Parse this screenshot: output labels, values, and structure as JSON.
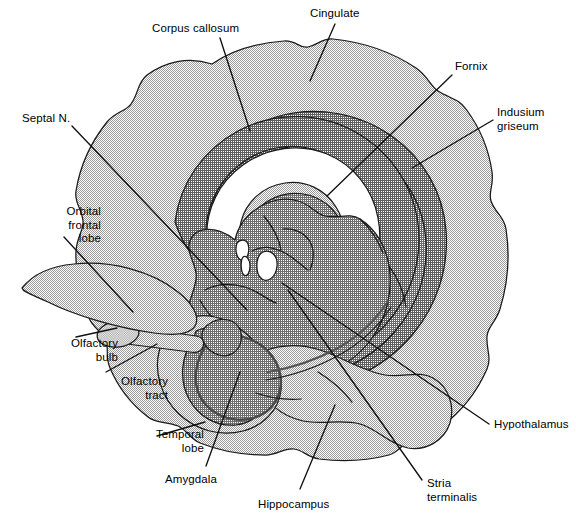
{
  "figure": {
    "type": "anatomical-diagram",
    "background_color": "#ffffff",
    "line_color": "#1a1a1a",
    "palette": {
      "cortex_light": "#c9c9c9",
      "band_medium": "#a8a8a8",
      "band_dark": "#8f8f8f",
      "core_gray": "#9d9d9d",
      "white_space": "#ffffff",
      "outline": "#1a1a1a"
    }
  },
  "labels": [
    {
      "id": "corpus-callosum",
      "text": "Corpus callosum",
      "align": "center",
      "x": 152,
      "y": 22
    },
    {
      "id": "cingulate",
      "text": "Cingulate",
      "align": "center",
      "x": 310,
      "y": 7
    },
    {
      "id": "fornix",
      "text": "Fornix",
      "align": "center",
      "x": 455,
      "y": 60
    },
    {
      "id": "indusium-griseum",
      "text": "Indusium\ngriseum",
      "align": "left",
      "x": 497,
      "y": 106
    },
    {
      "id": "septal-n",
      "text": "Septal N.",
      "align": "left",
      "x": 22,
      "y": 112
    },
    {
      "id": "orbital-frontal-lobe",
      "text": "Orbital\nfrontal\nlobe",
      "align": "right",
      "x": 5,
      "y": 205
    },
    {
      "id": "olfactory-bulb",
      "text": "Olfactory\nbulb",
      "align": "right",
      "x": 22,
      "y": 337
    },
    {
      "id": "olfactory-tract",
      "text": "Olfactory\ntract",
      "align": "right",
      "x": 72,
      "y": 375
    },
    {
      "id": "temporal-lobe",
      "text": "Temporal\nlobe",
      "align": "right",
      "x": 108,
      "y": 428
    },
    {
      "id": "amygdala",
      "text": "Amygdala",
      "align": "center",
      "x": 165,
      "y": 473
    },
    {
      "id": "hippocampus",
      "text": "Hippocampus",
      "align": "center",
      "x": 258,
      "y": 498
    },
    {
      "id": "stria-terminalis",
      "text": "Stria\nterminalis",
      "align": "left",
      "x": 427,
      "y": 477
    },
    {
      "id": "hypothalamus",
      "text": "Hypothalamus",
      "align": "left",
      "x": 494,
      "y": 418
    }
  ],
  "leader_lines": [
    {
      "id": "corpus-callosum",
      "x1": 220,
      "y1": 38,
      "x2": 250,
      "y2": 131
    },
    {
      "id": "cingulate",
      "x1": 335,
      "y1": 24,
      "x2": 310,
      "y2": 81
    },
    {
      "id": "fornix",
      "x1": 452,
      "y1": 75,
      "x2": 327,
      "y2": 196
    },
    {
      "id": "indusium-griseum",
      "x1": 493,
      "y1": 120,
      "x2": 412,
      "y2": 168
    },
    {
      "id": "septal-n",
      "x1": 72,
      "y1": 126,
      "x2": 247,
      "y2": 310
    },
    {
      "id": "orbital-frontal-lobe",
      "x1": 64,
      "y1": 237,
      "x2": 133,
      "y2": 312
    },
    {
      "id": "olfactory-bulb",
      "x1": 76,
      "y1": 337,
      "x2": 117,
      "y2": 328
    },
    {
      "id": "olfactory-tract",
      "x1": 106,
      "y1": 372,
      "x2": 157,
      "y2": 344
    },
    {
      "id": "temporal-lobe",
      "x1": 157,
      "y1": 436,
      "x2": 205,
      "y2": 422
    },
    {
      "id": "amygdala",
      "x1": 206,
      "y1": 466,
      "x2": 240,
      "y2": 372
    },
    {
      "id": "hippocampus",
      "x1": 300,
      "y1": 489,
      "x2": 335,
      "y2": 405
    },
    {
      "id": "stria-terminalis",
      "x1": 422,
      "y1": 480,
      "x2": 288,
      "y2": 290
    },
    {
      "id": "hypothalamus",
      "x1": 489,
      "y1": 424,
      "x2": 282,
      "y2": 283
    }
  ]
}
